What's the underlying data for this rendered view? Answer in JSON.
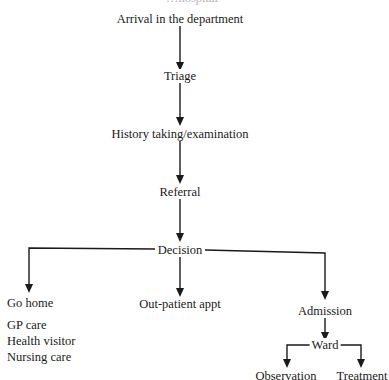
{
  "caption_fragment": "…hospital",
  "nodes": {
    "arrival": "Arrival in the department",
    "triage": "Triage",
    "history": "History taking/examination",
    "referral": "Referral",
    "decision": "Decision",
    "go_home": "Go home",
    "outpatient": "Out-patient appt",
    "admission": "Admission",
    "ward": "Ward",
    "observation": "Observation",
    "treatment": "Treatment"
  },
  "go_home_options": [
    "GP care",
    "Health visitor",
    "Nursing care"
  ],
  "colors": {
    "line": "#1a1a1a",
    "text": "#1a1a1a",
    "background": "#ffffff"
  }
}
